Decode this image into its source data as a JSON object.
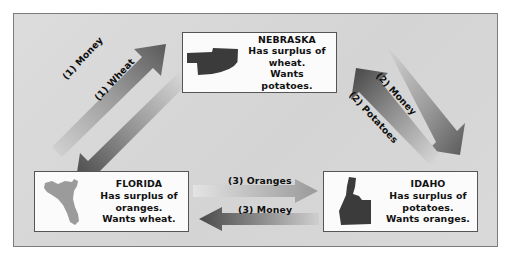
{
  "diagram": {
    "background_color": "#d8d8d8",
    "frame_color": "#7c7c7c",
    "box_fill": "#fbfbfb",
    "box_border": "#555555"
  },
  "nodes": [
    {
      "id": "nebraska",
      "name": "NEBRASKA",
      "line1": "Has surplus of",
      "line2": "wheat.",
      "line3": "Wants potatoes.",
      "map_icon": "nebraska-state-shape",
      "map_color": "#3b3b3b"
    },
    {
      "id": "florida",
      "name": "FLORIDA",
      "line1": "Has surplus of",
      "line2": "oranges.",
      "line3": "Wants wheat.",
      "map_icon": "florida-state-shape",
      "map_color": "#9b9b9b"
    },
    {
      "id": "idaho",
      "name": "IDAHO",
      "line1": "Has surplus of",
      "line2": "potatoes.",
      "line3": "Wants oranges.",
      "map_icon": "idaho-state-shape",
      "map_color": "#3b3b3b"
    }
  ],
  "flows": [
    {
      "id": "money1",
      "label": "(1) Money",
      "from": "florida",
      "to": "nebraska",
      "direction": "up-right",
      "gradient_from": "#d2d2d2",
      "gradient_to": "#5e5e5e"
    },
    {
      "id": "wheat1",
      "label": "(1) Wheat",
      "from": "nebraska",
      "to": "florida",
      "direction": "down-left",
      "gradient_from": "#d9d9d9",
      "gradient_to": "#4a4a4a"
    },
    {
      "id": "money2",
      "label": "(2) Money",
      "from": "nebraska",
      "to": "idaho",
      "direction": "down-right",
      "gradient_from": "#d2d2d2",
      "gradient_to": "#5e5e5e"
    },
    {
      "id": "potatoes2",
      "label": "(2) Potatoes",
      "from": "idaho",
      "to": "nebraska",
      "direction": "up-left",
      "gradient_from": "#d9d9d9",
      "gradient_to": "#4a4a4a"
    },
    {
      "id": "oranges3",
      "label": "(3) Oranges",
      "from": "florida",
      "to": "idaho",
      "direction": "right",
      "gradient_from": "#e2e2e2",
      "gradient_to": "#9a9a9a"
    },
    {
      "id": "money3",
      "label": "(3) Money",
      "from": "idaho",
      "to": "florida",
      "direction": "left",
      "gradient_from": "#c9c9c9",
      "gradient_to": "#4f4f4f"
    }
  ]
}
